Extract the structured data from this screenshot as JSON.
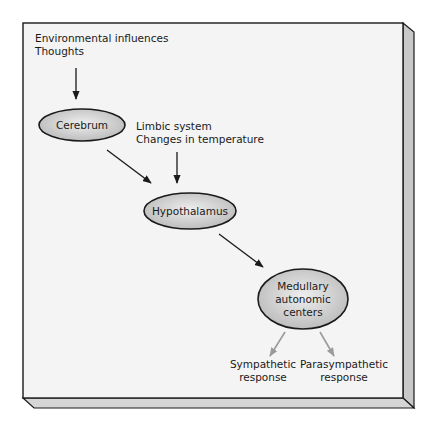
{
  "diagram": {
    "title": "",
    "colors": {
      "panel_face": "#f4f4f4",
      "panel_edge": "#1a1a1a",
      "panel_side": "#c8c8c8",
      "node_fill_center": "#eeeeee",
      "node_fill_edge": "#b9b9b9",
      "arrow_dark": "#1a1a1a",
      "arrow_light": "#9a9a9a"
    },
    "inputs": {
      "top": {
        "lines": [
          "Environmental influences",
          "Thoughts"
        ]
      },
      "limbic": {
        "lines": [
          "Limbic system",
          "Changes in temperature"
        ]
      }
    },
    "nodes": [
      {
        "id": "cerebrum",
        "label_lines": [
          "Cerebrum"
        ]
      },
      {
        "id": "hypothalamus",
        "label_lines": [
          "Hypothalamus"
        ]
      },
      {
        "id": "medullary",
        "label_lines": [
          "Medullary",
          "autonomic",
          "centers"
        ]
      }
    ],
    "outputs": [
      {
        "id": "sympathetic",
        "lines": [
          "Sympathetic",
          "response"
        ]
      },
      {
        "id": "parasympathetic",
        "lines": [
          "Parasympathetic",
          "response"
        ]
      }
    ],
    "edges": [
      {
        "from": "top-inputs",
        "to": "cerebrum",
        "style": "dark"
      },
      {
        "from": "cerebrum",
        "to": "hypothalamus",
        "style": "dark"
      },
      {
        "from": "limbic-inputs",
        "to": "hypothalamus",
        "style": "dark"
      },
      {
        "from": "hypothalamus",
        "to": "medullary",
        "style": "dark"
      },
      {
        "from": "medullary",
        "to": "sympathetic",
        "style": "light"
      },
      {
        "from": "medullary",
        "to": "parasympathetic",
        "style": "light"
      }
    ]
  }
}
